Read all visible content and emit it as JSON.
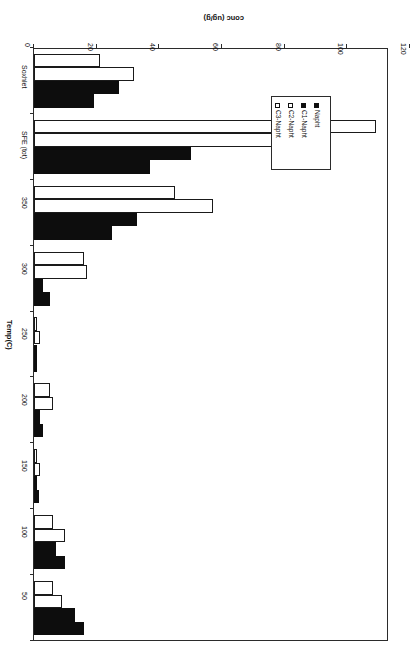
{
  "chart_data": {
    "type": "bar",
    "orientation": "horizontal",
    "title": "",
    "xlabel": "Temp(C)",
    "ylabel": "conc (ug/g)",
    "categories": [
      "50",
      "100",
      "150",
      "200",
      "250",
      "300",
      "350",
      "SFE (tot)",
      "Soxhlet"
    ],
    "category_axis_title": "Temp(C)",
    "value_axis_title": "conc (ug/g)",
    "value_ticks": [
      "0",
      "20",
      "40",
      "60",
      "80",
      "100",
      "120"
    ],
    "value_tick_values": [
      0,
      20,
      40,
      60,
      80,
      100,
      120
    ],
    "ylim": [
      0,
      120
    ],
    "grid": false,
    "legend_position": "middle-left",
    "rotated_180": true,
    "series": [
      {
        "name": "Napht",
        "fill": "filled",
        "color": "#0d0d0d",
        "values": [
          16,
          10,
          1.5,
          3,
          1,
          5,
          25,
          37,
          19
        ]
      },
      {
        "name": "C1-Napht",
        "fill": "filled",
        "color": "#0d0d0d",
        "values": [
          13,
          7,
          1,
          2,
          1,
          3,
          33,
          50,
          27
        ]
      },
      {
        "name": "C2-Napht",
        "fill": "hollow",
        "color": "#ffffff",
        "values": [
          9,
          10,
          2,
          6,
          2,
          17,
          57,
          87,
          32
        ]
      },
      {
        "name": "C3-Napht",
        "fill": "hollow",
        "color": "#ffffff",
        "values": [
          6,
          6,
          1,
          5,
          1,
          16,
          45,
          109,
          21
        ]
      }
    ]
  },
  "legend": {
    "entries": [
      {
        "label": "Napht",
        "fill": "filled"
      },
      {
        "label": "C1-Napht",
        "fill": "filled"
      },
      {
        "label": "C2-Napht",
        "fill": "hollow"
      },
      {
        "label": "C3-Napht",
        "fill": "hollow"
      }
    ]
  }
}
